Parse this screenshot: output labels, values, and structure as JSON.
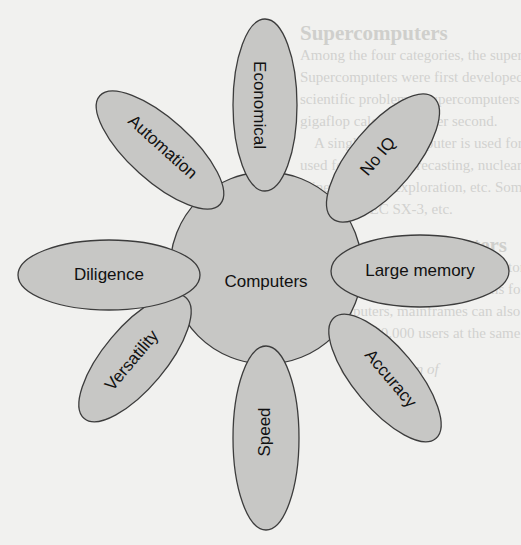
{
  "diagram": {
    "center": {
      "label": "Computers"
    },
    "petals": [
      {
        "label": "Economical"
      },
      {
        "label": "No IQ"
      },
      {
        "label": "Large memory"
      },
      {
        "label": "Accuracy"
      },
      {
        "label": "Speed"
      },
      {
        "label": "Versatility"
      },
      {
        "label": "Diligence"
      },
      {
        "label": "Automation"
      }
    ],
    "colors": {
      "fill": "#c7c7c5",
      "stroke": "#3c3c3c",
      "text": "#111111",
      "page": "#f1f1ef"
    }
  },
  "background_text": {
    "heading1": "Supercomputers",
    "lines1": [
      "Among the four categories, the supercomputer is",
      "Supercomputers were first developed in the \"80s",
      "scientific problems. Supercomputers are capable",
      "gigaflop calculations per second.",
      "A single supercomputer is used for intensive",
      "used for weather forecasting, nuclear energy res",
      "mine fields, oil exploration, etc. Some of the fas",
      "CRAY-2, NEC SX-3, etc."
    ],
    "heading2": "Mainframe Computers",
    "lines2": [
      "Mainframe computers have large storage (Mainframe computers (",
      "and need very large special rooms for accommodat",
      "size computers, mainframes can also support mu",
      "can support 50,000 users at the same time. Users u"
    ],
    "caption": "Classification of"
  }
}
